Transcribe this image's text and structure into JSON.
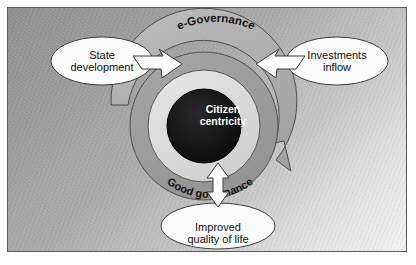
{
  "diagram": {
    "type": "concentric-cycle-diagram",
    "title_center": "Citizen\ncentricity",
    "ring_labels": {
      "outer_top": "e-Governance",
      "inner_bottom": "Good governance"
    },
    "nodes": [
      {
        "id": "state-development",
        "label": "State\ndevelopment",
        "position": "top-left"
      },
      {
        "id": "investments-inflow",
        "label": "Investments\ninflow",
        "position": "top-right"
      },
      {
        "id": "improved-quality-of-life",
        "label": "Improved\nquality of life",
        "position": "bottom-center"
      }
    ],
    "connectors": [
      {
        "id": "arrow-left-inward",
        "direction": "into-center",
        "style": "white-filled"
      },
      {
        "id": "arrow-right-inward",
        "direction": "into-center",
        "style": "white-filled"
      },
      {
        "id": "arrow-bottom-bidirectional",
        "direction": "bidirectional-vertical",
        "style": "white-filled"
      },
      {
        "id": "arrow-outer-cycle",
        "direction": "clockwise",
        "style": "gray-filled"
      }
    ],
    "colors": {
      "frame_border": "#5d5d5d",
      "background_dark": "#8e8e8e",
      "background_light": "#f2f2f2",
      "ring_outer_arrow": "#b0b0b0",
      "ring_text_band": "#9d9d9d",
      "ring_inner_disc": "#dcdcdc",
      "core": "#141414",
      "core_text": "#ffffff",
      "node_fill": "#fbfbfb",
      "node_stroke": "#4a4a4a",
      "arrow_fill": "#ffffff",
      "arrow_stroke": "#3a3a3a"
    }
  }
}
